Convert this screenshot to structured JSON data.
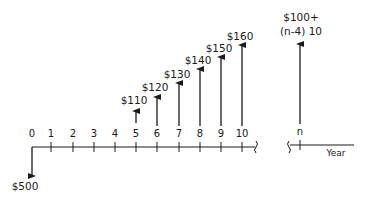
{
  "diagram": {
    "type": "cash-flow-diagram",
    "axis": {
      "label": "Year",
      "ticks": [
        "0",
        "1",
        "2",
        "3",
        "4",
        "5",
        "6",
        "7",
        "8",
        "9",
        "10",
        "n"
      ],
      "break_between": [
        "10",
        "n"
      ]
    },
    "cash_flows": [
      {
        "year": "0",
        "direction": "down",
        "label": "$500",
        "amount": -500
      },
      {
        "year": "5",
        "direction": "up",
        "label": "$110",
        "amount": 110
      },
      {
        "year": "6",
        "direction": "up",
        "label": "$120",
        "amount": 120
      },
      {
        "year": "7",
        "direction": "up",
        "label": "$130",
        "amount": 130
      },
      {
        "year": "8",
        "direction": "up",
        "label": "$140",
        "amount": 140
      },
      {
        "year": "9",
        "direction": "up",
        "label": "$150",
        "amount": 150
      },
      {
        "year": "10",
        "direction": "up",
        "label": "$160",
        "amount": 160
      },
      {
        "year": "n",
        "direction": "up",
        "label_line1": "$100+",
        "label_line2": "(n-4) 10"
      }
    ],
    "colors": {
      "ink": "#1a1a1a",
      "background": "#ffffff"
    }
  }
}
